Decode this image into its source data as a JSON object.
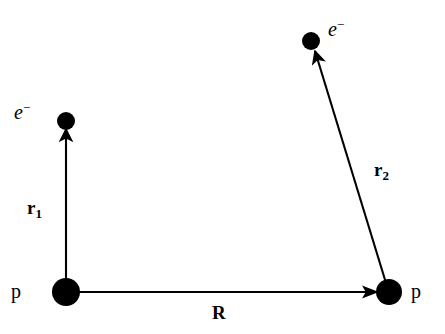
{
  "figure": {
    "background_color": "#ffffff",
    "stroke_color": "#000000",
    "width": 445,
    "height": 334
  },
  "particles": [
    {
      "id": "electron-1",
      "label": "e",
      "charge": "−",
      "kind": "electron",
      "cx": 66,
      "cy": 121,
      "r": 9,
      "label_x": 14,
      "label_y": 101
    },
    {
      "id": "electron-2",
      "label": "e",
      "charge": "−",
      "kind": "electron",
      "cx": 311,
      "cy": 41,
      "r": 9,
      "label_x": 328,
      "label_y": 18
    },
    {
      "id": "proton-1",
      "label": "p",
      "charge": "",
      "kind": "proton",
      "cx": 66,
      "cy": 292,
      "r": 14,
      "label_x": 11,
      "label_y": 281
    },
    {
      "id": "proton-2",
      "label": "p",
      "charge": "",
      "kind": "proton",
      "cx": 389,
      "cy": 292,
      "r": 13,
      "label_x": 411,
      "label_y": 281
    }
  ],
  "vectors": [
    {
      "id": "r1",
      "symbol": "r",
      "subscript": "1",
      "from": "proton-1",
      "to": "electron-1",
      "x1": 66,
      "y1": 285,
      "x2": 66,
      "y2": 129,
      "label_x": 27,
      "label_y": 198
    },
    {
      "id": "r2",
      "symbol": "r",
      "subscript": "2",
      "from": "proton-2",
      "to": "electron-2",
      "x1": 386,
      "y1": 283,
      "x2": 315,
      "y2": 51,
      "label_x": 374,
      "label_y": 160
    },
    {
      "id": "R",
      "symbol": "R",
      "subscript": "",
      "from": "proton-1",
      "to": "proton-2",
      "x1": 78,
      "y1": 292,
      "x2": 378,
      "y2": 292,
      "label_x": 212,
      "label_y": 303
    }
  ]
}
